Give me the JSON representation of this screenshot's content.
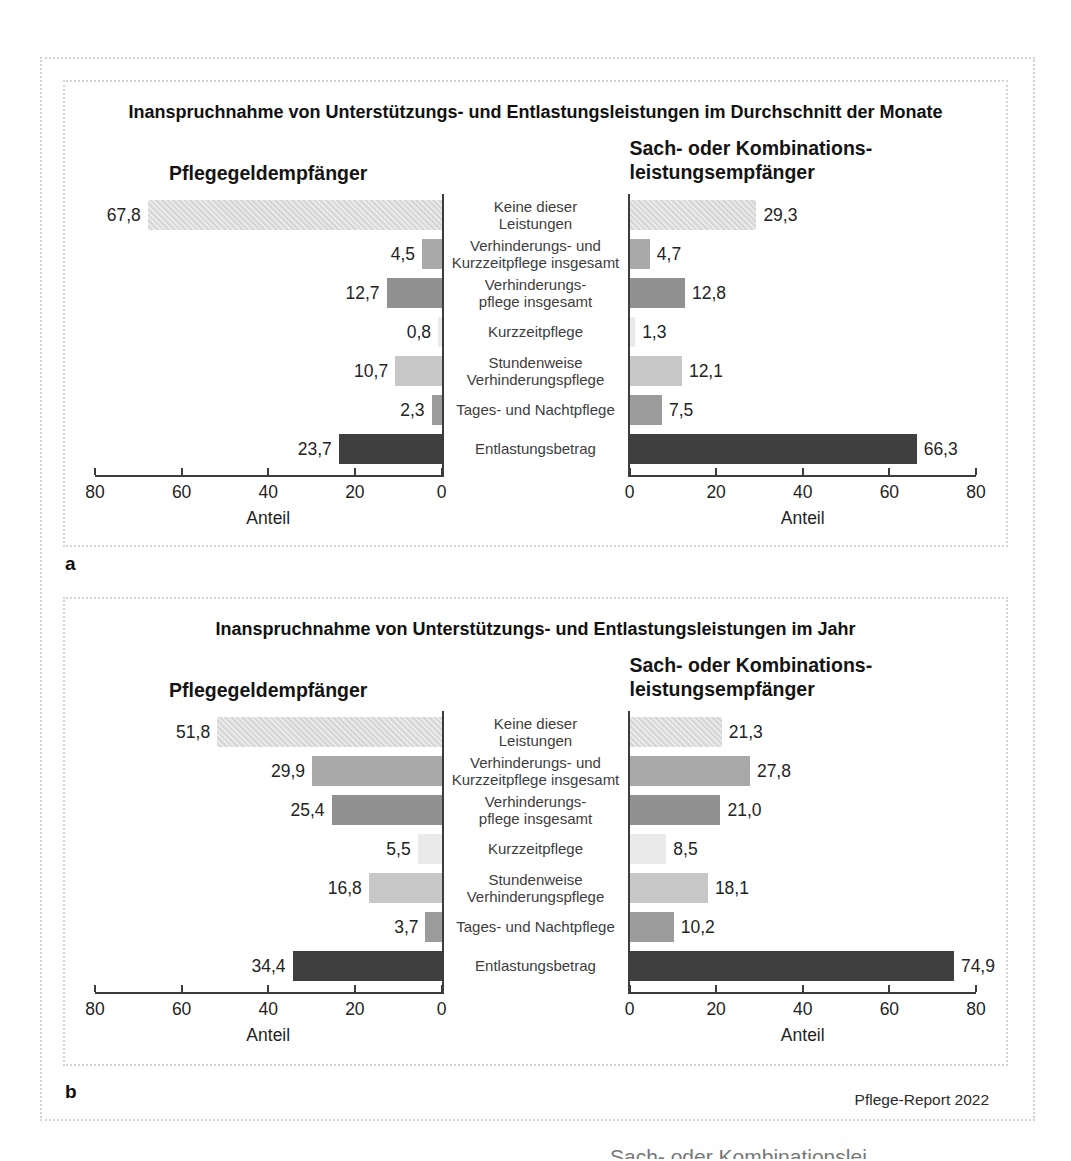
{
  "figure": {
    "panel_labels": [
      "a",
      "b"
    ],
    "source": "Pflege-Report 2022",
    "clipped_caption": "Sach- oder Kombinationslei"
  },
  "colors": {
    "axis": "#3c3c3c",
    "hatch_base": "#e9e9e9",
    "hatch_stripe": "#d6d6d6",
    "bar_styles": {
      "g_md": "#a9a9a9",
      "g_dk": "#919191",
      "g_xl": "#eaeaea",
      "g_lt": "#c7c7c7",
      "g_md2": "#9b9b9b",
      "g_dark": "#3f3f3f"
    }
  },
  "chart_data": [
    {
      "type": "bar",
      "orientation": "horizontal-butterfly",
      "title": "Inanspruchnahme von Unterstützungs- und Entlastungsleistungen im Durchschnitt der Monate",
      "xlabel": "Anteil",
      "xlim": [
        0,
        80
      ],
      "ticks": [
        0,
        20,
        40,
        60,
        80
      ],
      "categories": [
        [
          "Keine dieser",
          "Leistungen"
        ],
        [
          "Verhinderungs- und",
          "Kurzzeitpflege insgesamt"
        ],
        [
          "Verhinderungs-",
          "pflege insgesamt"
        ],
        [
          "Kurzzeitpflege"
        ],
        [
          "Stundenweise",
          "Verhinderungspflege"
        ],
        [
          "Tages- und Nachtpflege"
        ],
        [
          "Entlastungsbetrag"
        ]
      ],
      "category_styles": [
        "hatch",
        "g_md",
        "g_dk",
        "g_xl",
        "g_lt",
        "g_md2",
        "g_dark"
      ],
      "series": [
        {
          "name": "Pflegegeldempfänger",
          "name_lines": [
            "Pflegegeldempfänger"
          ],
          "side": "left",
          "values": [
            67.8,
            4.5,
            12.7,
            0.8,
            10.7,
            2.3,
            23.7
          ],
          "value_labels": [
            "67,8",
            "4,5",
            "12,7",
            "0,8",
            "10,7",
            "2,3",
            "23,7"
          ]
        },
        {
          "name": "Sach- oder Kombinationsleistungsempfänger",
          "name_lines": [
            "Sach- oder Kombinations-",
            "leistungsempfänger"
          ],
          "side": "right",
          "values": [
            29.3,
            4.7,
            12.8,
            1.3,
            12.1,
            7.5,
            66.3
          ],
          "value_labels": [
            "29,3",
            "4,7",
            "12,8",
            "1,3",
            "12,1",
            "7,5",
            "66,3"
          ]
        }
      ]
    },
    {
      "type": "bar",
      "orientation": "horizontal-butterfly",
      "title": "Inanspruchnahme von Unterstützungs- und Entlastungsleistungen im Jahr",
      "xlabel": "Anteil",
      "xlim": [
        0,
        80
      ],
      "ticks": [
        0,
        20,
        40,
        60,
        80
      ],
      "categories": [
        [
          "Keine dieser",
          "Leistungen"
        ],
        [
          "Verhinderungs- und",
          "Kurzzeitpflege insgesamt"
        ],
        [
          "Verhinderungs-",
          "pflege insgesamt"
        ],
        [
          "Kurzzeitpflege"
        ],
        [
          "Stundenweise",
          "Verhinderungspflege"
        ],
        [
          "Tages- und Nachtpflege"
        ],
        [
          "Entlastungsbetrag"
        ]
      ],
      "category_styles": [
        "hatch",
        "g_md",
        "g_dk",
        "g_xl",
        "g_lt",
        "g_md2",
        "g_dark"
      ],
      "series": [
        {
          "name": "Pflegegeldempfänger",
          "name_lines": [
            "Pflegegeldempfänger"
          ],
          "side": "left",
          "values": [
            51.8,
            29.9,
            25.4,
            5.5,
            16.8,
            3.7,
            34.4
          ],
          "value_labels": [
            "51,8",
            "29,9",
            "25,4",
            "5,5",
            "16,8",
            "3,7",
            "34,4"
          ]
        },
        {
          "name": "Sach- oder Kombinationsleistungsempfänger",
          "name_lines": [
            "Sach- oder Kombinations-",
            "leistungsempfänger"
          ],
          "side": "right",
          "values": [
            21.3,
            27.8,
            21.0,
            8.5,
            18.1,
            10.2,
            74.9
          ],
          "value_labels": [
            "21,3",
            "27,8",
            "21,0",
            "8,5",
            "18,1",
            "10,2",
            "74,9"
          ]
        }
      ]
    }
  ]
}
